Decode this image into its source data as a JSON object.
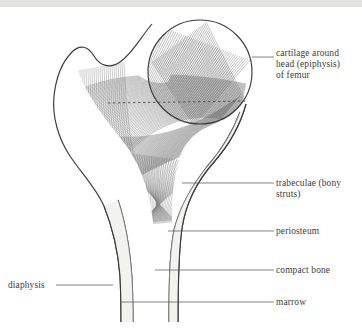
{
  "figure": {
    "background_color": "#ffffff",
    "ink_color": "#3b3b3b",
    "hatch_color": "#6a6a6a",
    "leader_color": "#5a5a5a",
    "scan_band_color": "#e3e3e1"
  },
  "labels": [
    {
      "id": "cartilage",
      "text": "cartilage around\nhead (epiphysis)\nof femur",
      "side": "right",
      "text_x": 276,
      "text_y": 48,
      "leader": {
        "x1": 252,
        "y1": 57,
        "x2": 274,
        "y2": 57
      }
    },
    {
      "id": "trabeculae",
      "text": "trabeculae (bony\nstruts)",
      "side": "right",
      "text_x": 276,
      "text_y": 178,
      "leader": {
        "x1": 182,
        "y1": 183,
        "x2": 274,
        "y2": 183
      }
    },
    {
      "id": "periosteum",
      "text": "periosteum",
      "side": "right",
      "text_x": 276,
      "text_y": 226,
      "leader": {
        "x1": 168,
        "y1": 231,
        "x2": 274,
        "y2": 231
      }
    },
    {
      "id": "compact-bone",
      "text": "compact bone",
      "side": "right",
      "text_x": 276,
      "text_y": 265,
      "leader": {
        "x1": 155,
        "y1": 270,
        "x2": 274,
        "y2": 270
      }
    },
    {
      "id": "marrow",
      "text": "marrow",
      "side": "right",
      "text_x": 276,
      "text_y": 297,
      "leader": {
        "x1": 120,
        "y1": 302,
        "x2": 274,
        "y2": 302
      }
    },
    {
      "id": "diaphysis",
      "text": "diaphysis",
      "side": "left",
      "text_x": 8,
      "text_y": 280,
      "leader": {
        "x1": 56,
        "y1": 285,
        "x2": 113,
        "y2": 285
      }
    }
  ],
  "anatomy": {
    "head": {
      "cx": 200,
      "cy": 72,
      "r": 52,
      "name": "femoral-head"
    },
    "epiphyseal_line": {
      "x1": 108,
      "y1": 103,
      "x2": 248,
      "y2": 101
    },
    "shaft": {
      "outer_left_top_x": 92,
      "outer_right_top_x": 178,
      "bottom_y": 322,
      "name": "diaphysis-shaft"
    },
    "trochanter": {
      "x": 62,
      "y": 92,
      "name": "greater-trochanter"
    }
  }
}
